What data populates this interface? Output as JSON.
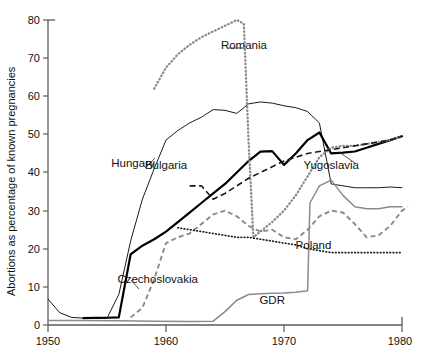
{
  "chart_data": {
    "type": "line",
    "title": "",
    "xlabel": "",
    "ylabel": "Abortions as percentage of known pregnancies",
    "xlim": [
      1950,
      1980
    ],
    "ylim": [
      0,
      80
    ],
    "xticks": [
      1950,
      1960,
      1970,
      1980
    ],
    "yticks": [
      0,
      10,
      20,
      30,
      40,
      50,
      60,
      70,
      80
    ],
    "grid": false,
    "legend_position": "inline-labels",
    "series": [
      {
        "name": "Hungary",
        "style": "solid-thin-black",
        "color": "#1a1a1a",
        "label_x": 1957.2,
        "label_y": 41.5,
        "points": [
          [
            1950,
            6.8
          ],
          [
            1951,
            3.2
          ],
          [
            1952,
            2.0
          ],
          [
            1953,
            1.8
          ],
          [
            1954,
            1.7
          ],
          [
            1955,
            1.8
          ],
          [
            1956,
            8.0
          ],
          [
            1957,
            22.0
          ],
          [
            1958,
            33.0
          ],
          [
            1959,
            41.0
          ],
          [
            1960,
            48.5
          ],
          [
            1961,
            51.0
          ],
          [
            1962,
            53.0
          ],
          [
            1963,
            54.5
          ],
          [
            1964,
            56.5
          ],
          [
            1965,
            56.3
          ],
          [
            1966,
            55.5
          ],
          [
            1967,
            58.0
          ],
          [
            1968,
            58.5
          ],
          [
            1969,
            58.2
          ],
          [
            1970,
            57.5
          ],
          [
            1971,
            57.0
          ],
          [
            1972,
            56.0
          ],
          [
            1973,
            53.0
          ],
          [
            1974,
            37.0
          ],
          [
            1975,
            36.5
          ],
          [
            1976,
            36.0
          ],
          [
            1977,
            36.0
          ],
          [
            1978,
            36.0
          ],
          [
            1979,
            36.2
          ],
          [
            1980,
            36.0
          ]
        ]
      },
      {
        "name": "Bulgaria",
        "style": "solid-thick-black",
        "color": "#000000",
        "label_x": 1960.0,
        "label_y": 41.0,
        "points": [
          [
            1953,
            1.8
          ],
          [
            1954,
            1.9
          ],
          [
            1955,
            1.9
          ],
          [
            1956,
            2.0
          ],
          [
            1957,
            18.5
          ],
          [
            1958,
            20.8
          ],
          [
            1959,
            22.5
          ],
          [
            1960,
            24.5
          ],
          [
            1961,
            27.0
          ],
          [
            1962,
            29.5
          ],
          [
            1963,
            32.0
          ],
          [
            1964,
            34.5
          ],
          [
            1965,
            37.0
          ],
          [
            1966,
            40.0
          ],
          [
            1967,
            43.0
          ],
          [
            1968,
            45.5
          ],
          [
            1969,
            45.6
          ],
          [
            1970,
            42.0
          ],
          [
            1971,
            45.0
          ],
          [
            1972,
            48.5
          ],
          [
            1973,
            50.5
          ],
          [
            1974,
            45.0
          ],
          [
            1975,
            45.2
          ],
          [
            1976,
            45.5
          ],
          [
            1977,
            46.5
          ],
          [
            1978,
            47.5
          ],
          [
            1979,
            48.5
          ],
          [
            1980,
            49.5
          ]
        ]
      },
      {
        "name": "Romania",
        "style": "dotted-thick-gray",
        "color": "#8a8a8a",
        "label_x": 1966.6,
        "label_y": 72.5,
        "points": [
          [
            1959,
            62.0
          ],
          [
            1960,
            67.5
          ],
          [
            1961,
            71.0
          ],
          [
            1962,
            73.5
          ],
          [
            1963,
            75.5
          ],
          [
            1964,
            77.0
          ],
          [
            1965,
            78.5
          ],
          [
            1966,
            80.0
          ],
          [
            1966.6,
            79.0
          ],
          [
            1967,
            48.0
          ],
          [
            1967.4,
            23.0
          ],
          [
            1968,
            24.5
          ],
          [
            1969,
            27.0
          ],
          [
            1970,
            30.0
          ],
          [
            1971,
            34.0
          ],
          [
            1972,
            39.0
          ],
          [
            1973,
            44.0
          ],
          [
            1974,
            46.5
          ],
          [
            1975,
            47.0
          ],
          [
            1976,
            47.0
          ],
          [
            1977,
            47.5
          ],
          [
            1978,
            48.0
          ],
          [
            1979,
            48.5
          ],
          [
            1980,
            49.5
          ]
        ]
      },
      {
        "name": "Czechoslovakia",
        "style": "dashed-gray",
        "color": "#8a8a8a",
        "label_x": 1959.3,
        "label_y": 11.0,
        "points": [
          [
            1957,
            2.0
          ],
          [
            1958,
            4.5
          ],
          [
            1959,
            12.0
          ],
          [
            1960,
            21.5
          ],
          [
            1961,
            23.0
          ],
          [
            1962,
            24.0
          ],
          [
            1963,
            26.5
          ],
          [
            1964,
            29.0
          ],
          [
            1965,
            30.0
          ],
          [
            1966,
            28.5
          ],
          [
            1967,
            26.0
          ],
          [
            1968,
            24.5
          ],
          [
            1969,
            25.0
          ],
          [
            1970,
            23.0
          ],
          [
            1971,
            22.5
          ],
          [
            1972,
            25.0
          ],
          [
            1973,
            28.5
          ],
          [
            1974,
            30.0
          ],
          [
            1975,
            29.5
          ],
          [
            1976,
            26.5
          ],
          [
            1977,
            23.0
          ],
          [
            1978,
            23.5
          ],
          [
            1979,
            26.0
          ],
          [
            1980,
            30.0
          ],
          [
            1980.5,
            31.0
          ]
        ]
      },
      {
        "name": "Yugoslavia",
        "style": "dashed-black",
        "color": "#1a1a1a",
        "label_x": 1974.0,
        "label_y": 41.0,
        "points": [
          [
            1962,
            36.5
          ],
          [
            1963,
            36.5
          ],
          [
            1964,
            33.0
          ],
          [
            1965,
            34.5
          ],
          [
            1966,
            36.5
          ],
          [
            1967,
            38.5
          ],
          [
            1968,
            40.0
          ],
          [
            1969,
            41.5
          ],
          [
            1970,
            43.0
          ],
          [
            1971,
            44.0
          ],
          [
            1972,
            45.0
          ],
          [
            1973,
            45.5
          ],
          [
            1974,
            46.0
          ],
          [
            1975,
            46.5
          ],
          [
            1976,
            47.0
          ],
          [
            1977,
            47.5
          ],
          [
            1978,
            48.0
          ],
          [
            1979,
            48.5
          ],
          [
            1980,
            49.5
          ]
        ]
      },
      {
        "name": "Poland",
        "style": "dotted-fine-black",
        "color": "#1a1a1a",
        "label_x": 1972.5,
        "label_y": 20.0,
        "points": [
          [
            1961,
            25.5
          ],
          [
            1962,
            25.0
          ],
          [
            1963,
            24.5
          ],
          [
            1964,
            24.0
          ],
          [
            1965,
            23.5
          ],
          [
            1966,
            23.0
          ],
          [
            1967,
            23.0
          ],
          [
            1968,
            22.5
          ],
          [
            1969,
            22.0
          ],
          [
            1970,
            21.5
          ],
          [
            1971,
            21.0
          ],
          [
            1972,
            20.0
          ],
          [
            1973,
            19.5
          ],
          [
            1974,
            19.0
          ],
          [
            1975,
            19.0
          ],
          [
            1976,
            19.0
          ],
          [
            1977,
            19.0
          ],
          [
            1978,
            19.0
          ],
          [
            1979,
            19.0
          ],
          [
            1980,
            19.0
          ]
        ]
      },
      {
        "name": "GDR",
        "style": "solid-gray",
        "color": "#8a8a8a",
        "label_x": 1969.0,
        "label_y": 5.5,
        "points": [
          [
            1950,
            1.2
          ],
          [
            1953,
            1.2
          ],
          [
            1956,
            1.1
          ],
          [
            1959,
            1.0
          ],
          [
            1962,
            0.9
          ],
          [
            1964,
            1.0
          ],
          [
            1965,
            3.5
          ],
          [
            1966,
            6.5
          ],
          [
            1967,
            8.0
          ],
          [
            1968,
            8.2
          ],
          [
            1969,
            8.3
          ],
          [
            1970,
            8.4
          ],
          [
            1971,
            8.6
          ],
          [
            1972,
            9.0
          ],
          [
            1972.2,
            32.0
          ],
          [
            1973,
            36.5
          ],
          [
            1974,
            38.0
          ],
          [
            1975,
            34.0
          ],
          [
            1976,
            31.0
          ],
          [
            1977,
            30.5
          ],
          [
            1978,
            30.5
          ],
          [
            1979,
            31.0
          ],
          [
            1980,
            31.0
          ]
        ]
      }
    ]
  },
  "labels": {
    "ylabel": "Abortions as percentage of known pregnancies",
    "hungary": "Hungary",
    "bulgaria": "Bulgaria",
    "romania": "Romania",
    "czechoslovakia": "Czechoslovakia",
    "yugoslavia": "Yugoslavia",
    "poland": "Poland",
    "gdr": "GDR",
    "y_0": "0",
    "y_10": "10",
    "y_20": "20",
    "y_30": "30",
    "y_40": "40",
    "y_50": "50",
    "y_60": "60",
    "y_70": "70",
    "y_80": "80",
    "x_1950": "1950",
    "x_1960": "1960",
    "x_1970": "1970",
    "x_1980": "1980"
  }
}
